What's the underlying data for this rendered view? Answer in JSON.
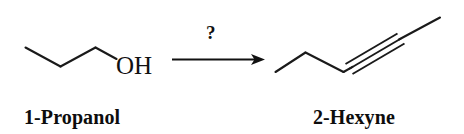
{
  "scheme": {
    "title": "Organic reaction scheme",
    "background_color": "#ffffff",
    "bond_color": "#1a1a1a",
    "text_color": "#0d0d0d"
  },
  "reactant": {
    "name": "1-Propanol",
    "hetero_label": "OH",
    "formula_hint": "CH3CH2CH2OH",
    "skeleton_points": "25,48 60,66 95,48 115,63"
  },
  "arrow": {
    "reagent_label": "?",
    "direction": "right",
    "shaft_x_start": 172,
    "shaft_x_end": 259,
    "shaft_y": 59
  },
  "product": {
    "name": "2-Hexyne",
    "formula_hint": "CH3CH2CH2C≡CCH3",
    "skeleton_points": "275,72 305,53 343,72",
    "triple_bond_start": "345,70",
    "triple_bond_end": "400,38",
    "terminal_point": "440,18"
  },
  "labels": {
    "reactant_name": "1-Propanol",
    "product_name": "2-Hexyne",
    "hydroxyl": "OH",
    "question_mark": "?"
  }
}
